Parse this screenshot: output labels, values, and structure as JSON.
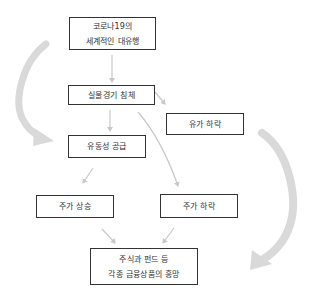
{
  "diagram": {
    "type": "flowchart",
    "colors": {
      "box_border": "#333333",
      "text": "#333333",
      "thin_arrow": "#c8c8c8",
      "big_arrow": "#d9d9d9"
    },
    "nodes": [
      {
        "id": "covid",
        "lines": [
          "코로나19의",
          "세계적인 대유행"
        ]
      },
      {
        "id": "recession",
        "lines": [
          "실물경기 침체"
        ]
      },
      {
        "id": "oil_drop",
        "lines": [
          "유가 하락"
        ]
      },
      {
        "id": "liquidity",
        "lines": [
          "유동성 공급"
        ]
      },
      {
        "id": "stock_up",
        "lines": [
          "주가 상승"
        ]
      },
      {
        "id": "stock_down",
        "lines": [
          "주가 하락"
        ]
      },
      {
        "id": "popularity",
        "lines": [
          "주식과 펀드 등",
          "각종 금융상품의 흥망"
        ]
      }
    ],
    "edges": [
      {
        "from": "covid",
        "to": "recession"
      },
      {
        "from": "recession",
        "to": "oil_drop"
      },
      {
        "from": "recession",
        "to": "liquidity"
      },
      {
        "from": "recession",
        "to": "stock_down"
      },
      {
        "from": "liquidity",
        "to": "stock_up"
      },
      {
        "from": "stock_up",
        "to": "popularity"
      },
      {
        "from": "stock_down",
        "to": "popularity"
      }
    ],
    "big_arrows": [
      {
        "side": "left",
        "from": "covid",
        "to": "liquidity"
      },
      {
        "side": "right",
        "from": "oil_drop",
        "to": "popularity"
      }
    ]
  }
}
